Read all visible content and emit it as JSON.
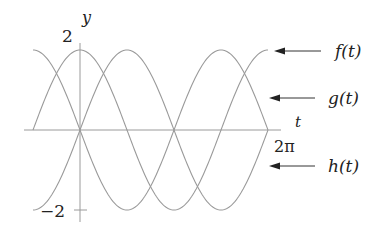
{
  "chart_data": {
    "type": "line",
    "title": "",
    "xlabel": "t",
    "ylabel": "y",
    "xlim": [
      -1.5708,
      6.2832
    ],
    "ylim": [
      -2,
      2
    ],
    "x_tick_labels": [
      {
        "value": 6.2832,
        "label": "2π"
      }
    ],
    "y_tick_labels": [
      {
        "value": 2,
        "label": "2"
      },
      {
        "value": -2,
        "label": "−2"
      }
    ],
    "grid": false,
    "legend_position": "right, arrows pointing to curve ends",
    "series": [
      {
        "name": "f(t)",
        "formula": "2cos(t)",
        "amplitude": 2,
        "phase": 0,
        "kind": "cos",
        "x": [
          -1.5708,
          0,
          1.5708,
          3.1416,
          4.7124,
          6.2832
        ],
        "values": [
          0,
          2,
          0,
          -2,
          0,
          2
        ]
      },
      {
        "name": "g(t)",
        "formula": "-2sin(t)",
        "amplitude": -2,
        "phase": 0,
        "kind": "sin",
        "x": [
          -1.5708,
          0,
          1.5708,
          3.1416,
          4.7124,
          6.2832
        ],
        "values": [
          2,
          0,
          -2,
          0,
          2,
          0
        ]
      },
      {
        "name": "h(t)",
        "formula": "2sin(t)",
        "amplitude": 2,
        "phase": 0,
        "kind": "sin",
        "x": [
          -1.5708,
          0,
          1.5708,
          3.1416,
          4.7124,
          6.2832
        ],
        "values": [
          -2,
          0,
          2,
          0,
          -2,
          0
        ]
      }
    ]
  },
  "labels": {
    "y_axis": "y",
    "t_axis": "t",
    "y_max": "2",
    "y_min": "−2",
    "x_max": "2π",
    "f": "f(t)",
    "g": "g(t)",
    "h": "h(t)"
  }
}
